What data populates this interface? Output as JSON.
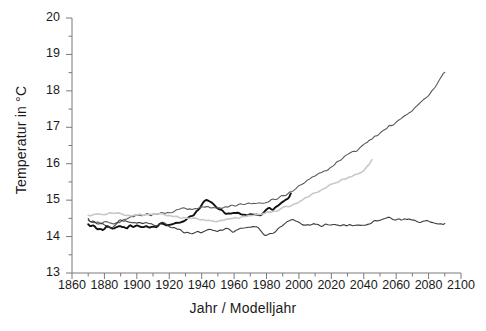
{
  "chart_data": {
    "type": "line",
    "title": "",
    "xlabel": "Jahr / Modelljahr",
    "ylabel": "Temperatur in °C",
    "xlim": [
      1860,
      2100
    ],
    "ylim": [
      13,
      20
    ],
    "grid": false,
    "legend_position": "none",
    "x_ticks": [
      1860,
      1880,
      1900,
      1920,
      1940,
      1960,
      1980,
      2000,
      2020,
      2040,
      2060,
      2080,
      2100
    ],
    "x_tick_labels": [
      "1860",
      "1880",
      "1900",
      "1920",
      "1940",
      "1960",
      "1980",
      "2000",
      "2020",
      "2040",
      "2060",
      "2080",
      "2100"
    ],
    "x_minor_tick_interval": 10,
    "y_ticks": [
      13,
      14,
      15,
      16,
      17,
      18,
      19,
      20
    ],
    "y_tick_labels": [
      "13",
      "14",
      "15",
      "16",
      "17",
      "18",
      "19",
      "20"
    ],
    "y_minor_tick_interval": 0.5,
    "series": [
      {
        "name": "Beobachtung",
        "color": "#111111",
        "width": 1.9,
        "x": [
          1870,
          1872,
          1874,
          1876,
          1878,
          1880,
          1882,
          1884,
          1886,
          1888,
          1890,
          1892,
          1894,
          1896,
          1898,
          1900,
          1902,
          1904,
          1906,
          1908,
          1910,
          1912,
          1914,
          1916,
          1918,
          1920,
          1922,
          1924,
          1926,
          1928,
          1930,
          1932,
          1934,
          1936,
          1938,
          1940,
          1942,
          1944,
          1946,
          1948,
          1950,
          1952,
          1954,
          1956,
          1958,
          1960,
          1962,
          1964,
          1966,
          1968,
          1970,
          1972,
          1974,
          1976,
          1978,
          1980,
          1982,
          1984,
          1986,
          1988,
          1990,
          1992,
          1994,
          1995
        ],
        "values": [
          14.3,
          14.32,
          14.28,
          14.22,
          14.18,
          14.2,
          14.26,
          14.22,
          14.18,
          14.26,
          14.3,
          14.24,
          14.22,
          14.3,
          14.26,
          14.32,
          14.3,
          14.26,
          14.3,
          14.24,
          14.28,
          14.26,
          14.34,
          14.32,
          14.3,
          14.34,
          14.38,
          14.36,
          14.42,
          14.4,
          14.46,
          14.52,
          14.56,
          14.62,
          14.72,
          14.84,
          14.96,
          15.02,
          14.94,
          14.86,
          14.76,
          14.72,
          14.66,
          14.58,
          14.64,
          14.62,
          14.66,
          14.58,
          14.62,
          14.6,
          14.66,
          14.62,
          14.6,
          14.58,
          14.66,
          14.74,
          14.78,
          14.72,
          14.8,
          14.88,
          14.96,
          14.98,
          15.08,
          15.22
        ]
      },
      {
        "name": "Modell A1B hoch",
        "color": "#5a5a5a",
        "width": 1.1,
        "x": [
          1870,
          1875,
          1880,
          1885,
          1890,
          1895,
          1900,
          1905,
          1910,
          1915,
          1920,
          1925,
          1930,
          1935,
          1940,
          1945,
          1950,
          1955,
          1960,
          1965,
          1970,
          1975,
          1980,
          1985,
          1990,
          1995,
          2000,
          2005,
          2010,
          2015,
          2020,
          2025,
          2030,
          2035,
          2040,
          2045,
          2050,
          2055,
          2060,
          2065,
          2070,
          2075,
          2080,
          2085,
          2090
        ],
        "values": [
          14.42,
          14.36,
          14.42,
          14.34,
          14.42,
          14.52,
          14.56,
          14.62,
          14.6,
          14.66,
          14.64,
          14.72,
          14.78,
          14.74,
          14.82,
          14.8,
          14.78,
          14.84,
          14.86,
          14.88,
          14.92,
          14.9,
          14.96,
          15.02,
          15.1,
          15.24,
          15.4,
          15.52,
          15.66,
          15.78,
          15.92,
          16.1,
          16.24,
          16.36,
          16.52,
          16.66,
          16.84,
          17.0,
          17.14,
          17.3,
          17.48,
          17.66,
          17.88,
          18.18,
          18.56
        ]
      },
      {
        "name": "Modell B1 niedrig",
        "color": "#c8c8c8",
        "width": 1.6,
        "x": [
          1870,
          1875,
          1880,
          1885,
          1890,
          1895,
          1900,
          1905,
          1910,
          1915,
          1920,
          1925,
          1930,
          1935,
          1940,
          1945,
          1950,
          1955,
          1960,
          1965,
          1970,
          1975,
          1980,
          1985,
          1990,
          1995,
          2000,
          2005,
          2010,
          2015,
          2020,
          2025,
          2030,
          2035,
          2040,
          2045
        ],
        "values": [
          14.56,
          14.62,
          14.6,
          14.66,
          14.62,
          14.58,
          14.6,
          14.58,
          14.62,
          14.6,
          14.58,
          14.54,
          14.52,
          14.5,
          14.46,
          14.44,
          14.42,
          14.46,
          14.5,
          14.54,
          14.58,
          14.6,
          14.64,
          14.7,
          14.78,
          14.86,
          14.96,
          15.08,
          15.2,
          15.3,
          15.42,
          15.52,
          15.62,
          15.7,
          15.8,
          16.08
        ]
      },
      {
        "name": "Kontrolllauf",
        "color": "#3c3c3c",
        "width": 1.1,
        "x": [
          1870,
          1875,
          1880,
          1885,
          1890,
          1895,
          1900,
          1905,
          1910,
          1915,
          1920,
          1925,
          1930,
          1935,
          1940,
          1945,
          1950,
          1955,
          1960,
          1965,
          1970,
          1975,
          1980,
          1985,
          1990,
          1995,
          2000,
          2005,
          2010,
          2015,
          2020,
          2025,
          2030,
          2035,
          2040,
          2045,
          2050,
          2055,
          2060,
          2065,
          2070,
          2075,
          2080,
          2085,
          2090
        ],
        "values": [
          14.46,
          14.38,
          14.32,
          14.26,
          14.46,
          14.4,
          14.34,
          14.38,
          14.3,
          14.36,
          14.3,
          14.2,
          14.12,
          14.1,
          14.14,
          14.18,
          14.16,
          14.22,
          14.14,
          14.24,
          14.3,
          14.24,
          14.0,
          14.14,
          14.34,
          14.48,
          14.38,
          14.3,
          14.36,
          14.3,
          14.34,
          14.32,
          14.3,
          14.32,
          14.3,
          14.38,
          14.48,
          14.52,
          14.46,
          14.5,
          14.44,
          14.38,
          14.42,
          14.36,
          14.34
        ]
      }
    ]
  }
}
